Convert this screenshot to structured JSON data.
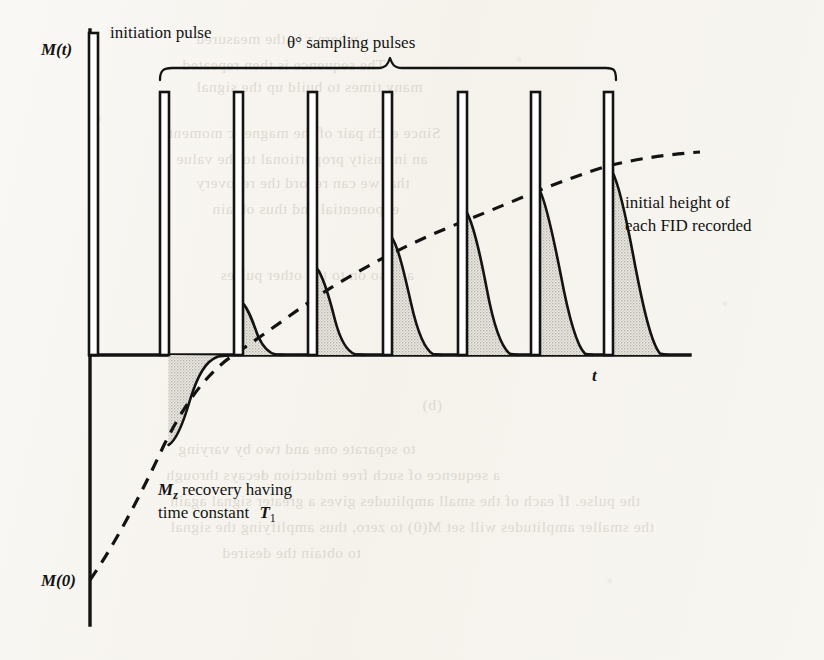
{
  "figure": {
    "kind": "nmr-inversion-recovery-pulse-sequence",
    "axes": {
      "y_axis_label": "M(t)",
      "x_axis_label": "t",
      "origin_label": "M(0)"
    },
    "annotations": {
      "initiation_pulse": "initiation pulse",
      "sampling_pulses": "θ° sampling pulses",
      "fid_height_line1": "initial height of",
      "fid_height_line2": "each FID recorded",
      "recovery_line1_prefix": "M",
      "recovery_line1_sub": "z",
      "recovery_line1_rest": " recovery having",
      "recovery_line2": "time constant ",
      "recovery_line2_symbol": "T",
      "recovery_line2_sub": "1"
    },
    "colors": {
      "ink": "#131313",
      "fid_fill": "#d8d4cd",
      "paper": "#f8f6f2",
      "bleed_text": "#b9b2a6"
    }
  },
  "chart_data": {
    "type": "line",
    "xlabel": "t",
    "ylabel": "M(t)",
    "grid": false,
    "legend": "none",
    "axis_geometry": {
      "y_axis_x": 90,
      "baseline_y": 355,
      "y_axis_top": 30,
      "y_axis_bottom": 625,
      "baseline_right": 690,
      "m0_level_y": 580,
      "asymptote_y": 157
    },
    "initiation_pulse": {
      "x": 93,
      "top_y": 33,
      "width": 9
    },
    "pulse_x": [
      164,
      238,
      312,
      387,
      462,
      535,
      608
    ],
    "pulse_top_y": 92,
    "pulse_width": 9,
    "fid_tip_y": [
      445,
      303,
      268,
      237,
      212,
      190,
      172
    ],
    "fid_direction": [
      "down",
      "up",
      "up",
      "up",
      "up",
      "up",
      "up"
    ],
    "recovery_curve_points": [
      [
        90,
        580
      ],
      [
        110,
        545
      ],
      [
        130,
        512
      ],
      [
        150,
        478
      ],
      [
        164,
        445
      ],
      [
        185,
        415
      ],
      [
        210,
        385
      ],
      [
        238,
        352
      ],
      [
        262,
        330
      ],
      [
        290,
        312
      ],
      [
        312,
        300
      ],
      [
        340,
        285
      ],
      [
        366,
        272
      ],
      [
        387,
        263
      ],
      [
        415,
        250
      ],
      [
        440,
        240
      ],
      [
        462,
        232
      ],
      [
        490,
        222
      ],
      [
        515,
        213
      ],
      [
        535,
        206
      ],
      [
        560,
        196
      ],
      [
        585,
        186
      ],
      [
        608,
        178
      ],
      [
        635,
        169
      ],
      [
        665,
        162
      ],
      [
        700,
        157
      ]
    ],
    "bracket": {
      "x_start": 160,
      "x_end": 615,
      "y": 75,
      "peak_x": 390,
      "peak_y": 58
    }
  },
  "bleed_through": {
    "lines": [
      {
        "text": "where τ is the measured",
        "x": 196,
        "y": 30
      },
      {
        "text": "The sequence is then repeated",
        "x": 182,
        "y": 56
      },
      {
        "text": "many times to build up the signal",
        "x": 196,
        "y": 78
      },
      {
        "text": "Since each pair of the magnetic moment",
        "x": 168,
        "y": 124
      },
      {
        "text": "an intensity proportional to the value",
        "x": 176,
        "y": 150
      },
      {
        "text": "that we can record the recovery",
        "x": 196,
        "y": 174
      },
      {
        "text": "exponential and thus obtain",
        "x": 212,
        "y": 200
      },
      {
        "text": "and so on to the other pulses",
        "x": 220,
        "y": 266
      },
      {
        "text": "(b)",
        "x": 422,
        "y": 396
      },
      {
        "text": "to separate one and two by varying",
        "x": 178,
        "y": 440
      },
      {
        "text": "a sequence of such free induction decays through",
        "x": 166,
        "y": 466
      },
      {
        "text": "the pulse. If each of the small amplitudes gives a greater signal again",
        "x": 170,
        "y": 492
      },
      {
        "text": "the smaller amplitudes will set M(0) to zero, thus amplifying the signal",
        "x": 170,
        "y": 518
      },
      {
        "text": "to obtain the desired",
        "x": 222,
        "y": 544
      }
    ]
  }
}
